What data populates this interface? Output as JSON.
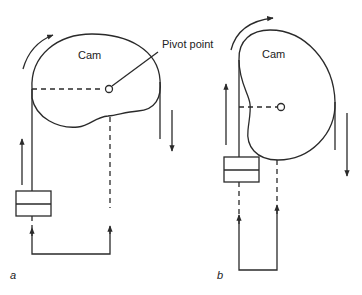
{
  "diagram": {
    "type": "mechanical cam and belt schematic",
    "panels": [
      {
        "id": "a",
        "label": "a",
        "cam_label": "Cam",
        "pivot_label": "Pivot point",
        "rotation": "clockwise",
        "components": [
          "cam",
          "pivot point",
          "belt lines",
          "slider block",
          "return loop"
        ]
      },
      {
        "id": "b",
        "label": "b",
        "cam_label": "Cam",
        "rotation": "clockwise",
        "components": [
          "kidney-shaped cam",
          "pivot point",
          "belt lines",
          "slider block",
          "return loop"
        ]
      }
    ],
    "colors": {
      "line": "#2a2a2a",
      "background": "#ffffff"
    }
  }
}
